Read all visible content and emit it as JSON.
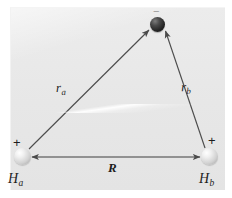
{
  "figure": {
    "background_color": "#e9e9e9",
    "page_color": "#ffffff",
    "stroke_color": "#4a4a4a"
  },
  "particles": [
    {
      "id": "proton-a",
      "label": "H",
      "subscript": "a",
      "charge_sign": "+",
      "kind": "proton",
      "color": "#d2d2d2",
      "cx": 22,
      "cy": 156
    },
    {
      "id": "proton-b",
      "label": "H",
      "subscript": "b",
      "charge_sign": "+",
      "kind": "proton",
      "color": "#d2d2d2",
      "cx": 209,
      "cy": 156
    },
    {
      "id": "electron",
      "label": "e",
      "subscript": "",
      "charge_sign": "−",
      "kind": "electron",
      "color": "#242424",
      "cx": 157,
      "cy": 24
    }
  ],
  "vectors": [
    {
      "id": "r-a",
      "label": "r",
      "subscript": "a",
      "from": "proton-a",
      "to": "electron",
      "arrowheads": "end",
      "x1": 29,
      "y1": 149,
      "x2": 150,
      "y2": 29
    },
    {
      "id": "r-b",
      "label": "r",
      "subscript": "b",
      "from": "proton-b",
      "to": "electron",
      "arrowheads": "end",
      "x1": 205,
      "y1": 148,
      "x2": 165,
      "y2": 30
    },
    {
      "id": "R",
      "label": "R",
      "subscript": "",
      "from": "proton-a",
      "to": "proton-b",
      "arrowheads": "both",
      "x1": 31,
      "y1": 157,
      "x2": 201,
      "y2": 157
    }
  ],
  "labels": {
    "r_a": "r",
    "r_a_sub": "a",
    "r_b": "r",
    "r_b_sub": "b",
    "R": "R",
    "H_a": "H",
    "H_a_sub": "a",
    "H_b": "H",
    "H_b_sub": "b",
    "plus_a": "+",
    "plus_b": "+",
    "minus_e": "−"
  }
}
